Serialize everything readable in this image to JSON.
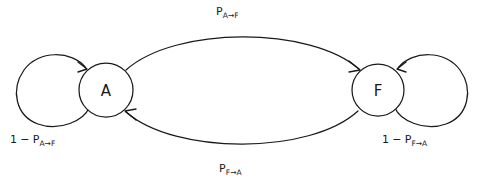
{
  "diagram": {
    "type": "state-transition-diagram",
    "background_color": "#ffffff",
    "stroke_color": "#1a1a1a",
    "nodes": [
      {
        "id": "A",
        "label": "A",
        "cx": 106,
        "cy": 90,
        "r": 27
      },
      {
        "id": "F",
        "label": "F",
        "cx": 378,
        "cy": 90,
        "r": 26
      }
    ],
    "edges": [
      {
        "id": "a-to-f",
        "from": "A",
        "to": "F",
        "kind": "arc-top",
        "label_prefix": "P",
        "label_sub": "A→F",
        "label_full": "P A→F"
      },
      {
        "id": "f-to-a",
        "from": "F",
        "to": "A",
        "kind": "arc-bottom",
        "label_prefix": "P",
        "label_sub": "F→A",
        "label_full": "P F→A"
      },
      {
        "id": "a-self",
        "from": "A",
        "to": "A",
        "kind": "self-loop-left",
        "label_one": "1",
        "label_minus": "−",
        "label_prefix": "P",
        "label_sub": "A→F",
        "label_full": "1 − P A→F"
      },
      {
        "id": "f-self",
        "from": "F",
        "to": "F",
        "kind": "self-loop-right",
        "label_one": "1",
        "label_minus": "−",
        "label_prefix": "P",
        "label_sub": "F→A",
        "label_full": "1 − P F→A"
      }
    ]
  }
}
